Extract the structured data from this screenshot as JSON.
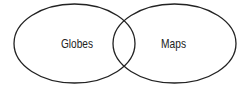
{
  "diagram": {
    "type": "venn",
    "sets": [
      {
        "label": "Globes"
      },
      {
        "label": "Maps"
      }
    ],
    "stroke_color": "#222222",
    "background": "#ffffff"
  }
}
